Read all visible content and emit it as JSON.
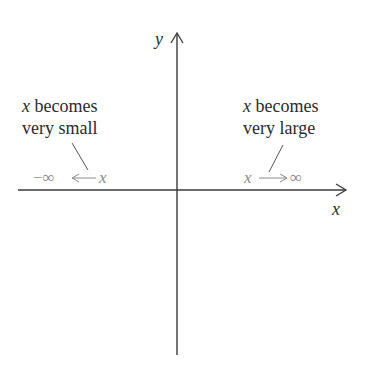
{
  "diagram": {
    "axes": {
      "x_label": "x",
      "y_label": "y"
    },
    "left_annotation": {
      "var": "x",
      "line1_rest": " becomes",
      "line2": "very small",
      "expression_neg_inf": "−∞",
      "expression_var": "x"
    },
    "right_annotation": {
      "var": "x",
      "line1_rest": " becomes",
      "line2": "very large",
      "expression_var": "x",
      "expression_inf": "∞"
    },
    "colors": {
      "axis": "#3a3a3a",
      "text": "#2b2b2b",
      "annotation_gray": "#8a8a8a"
    }
  }
}
